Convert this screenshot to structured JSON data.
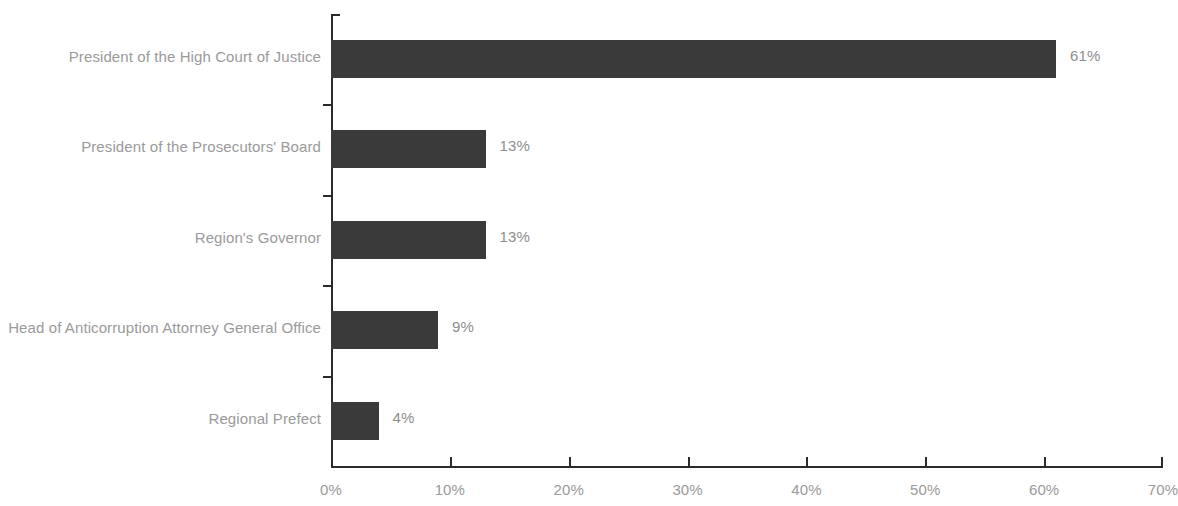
{
  "chart_data": {
    "type": "bar",
    "orientation": "horizontal",
    "title": "",
    "subtitle": "",
    "xlabel": "",
    "ylabel": "",
    "categories": [
      "President of the High Court of Justice",
      "President of the Prosecutors' Board",
      "Region's Governor",
      "Head of Anticorruption Attorney General Office",
      "Regional Prefect"
    ],
    "values": [
      61,
      13,
      13,
      9,
      4
    ],
    "value_labels": [
      "61%",
      "13%",
      "13%",
      "9%",
      "4%"
    ],
    "xlim": [
      0,
      70
    ],
    "xticks": [
      0,
      10,
      20,
      30,
      40,
      50,
      60,
      70
    ],
    "xtick_labels": [
      "0%",
      "10%",
      "20%",
      "30%",
      "40%",
      "50%",
      "60%",
      "70%"
    ],
    "grid": false,
    "legend": false,
    "bar_color": "#3a3a3a",
    "axis_color": "#2b2b2b",
    "label_color": "#9a9a9a",
    "value_label_color": "#8d8d8d",
    "background": "#ffffff"
  }
}
